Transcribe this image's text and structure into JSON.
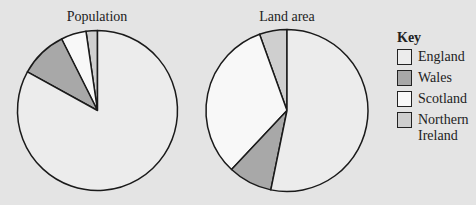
{
  "chart_data": [
    {
      "type": "pie",
      "title": "Population",
      "categories": [
        "England",
        "Wales",
        "Scotland",
        "Northern Ireland"
      ],
      "values": [
        83,
        9.6,
        5.1,
        2.3
      ],
      "unit": "percent (estimated)"
    },
    {
      "type": "pie",
      "title": "Land area",
      "categories": [
        "England",
        "Wales",
        "Scotland",
        "Northern Ireland"
      ],
      "values": [
        53.2,
        8.8,
        32.5,
        5.5
      ],
      "unit": "percent (estimated)"
    }
  ],
  "legend": {
    "title": "Key",
    "placement": "right",
    "items": [
      {
        "label": "England",
        "color": "#ececec"
      },
      {
        "label": "Wales",
        "color": "#a8a8a8"
      },
      {
        "label": "Scotland",
        "color": "#f8f8f8"
      },
      {
        "label": "Northern Ireland",
        "color": "#cfcfcf"
      }
    ]
  },
  "slice_order_note": "drawn counter-clockwise from 12 o'clock: Northern Ireland, Scotland, Wales, England"
}
